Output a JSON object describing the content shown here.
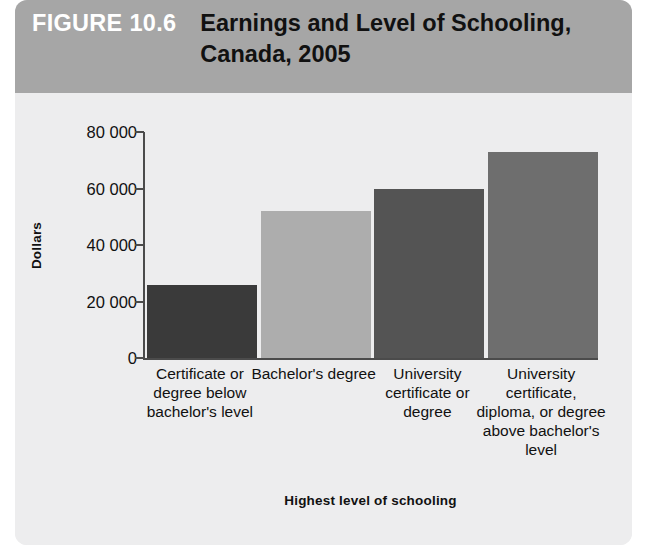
{
  "figure": {
    "number_label": "FIGURE 10.6",
    "title": "Earnings and Level of Schooling, Canada, 2005"
  },
  "colors": {
    "header_band": "#a6a6a6",
    "panel_background": "#ededee",
    "axis": "#4b4b4b",
    "figure_number_text": "#ffffff",
    "title_text": "#111111"
  },
  "chart_data": {
    "type": "bar",
    "title": "Earnings and Level of Schooling, Canada, 2005",
    "xlabel": "Highest level of schooling",
    "ylabel": "Dollars",
    "categories": [
      "Certificate or degree below bachelor's level",
      "Bachelor's degree",
      "University certificate or degree",
      "University certificate, diploma, or degree above bachelor's level"
    ],
    "values": [
      26000,
      52000,
      60000,
      73000
    ],
    "bar_colors": [
      "#3a3a3a",
      "#adadad",
      "#545454",
      "#6e6e6e"
    ],
    "ylim": [
      0,
      80000
    ],
    "yticks": [
      0,
      20000,
      40000,
      60000,
      80000
    ],
    "ytick_labels": [
      "0",
      "20 000",
      "40 000",
      "60 000",
      "80 000"
    ],
    "grid": false,
    "legend": false
  }
}
